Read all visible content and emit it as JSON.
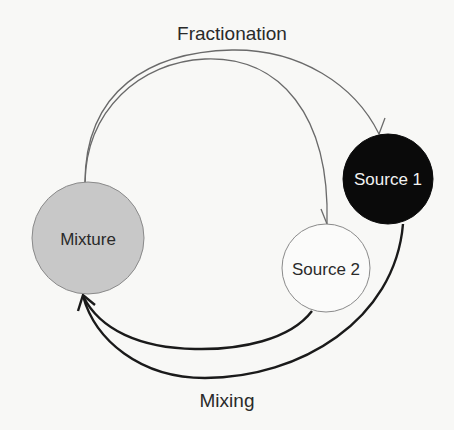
{
  "diagram": {
    "type": "cycle",
    "nodes": [
      {
        "id": "mixture",
        "label": "Mixture",
        "fill": "#c8c8c8",
        "stroke": "#8a8a8a",
        "text_color": "#2a2a2a"
      },
      {
        "id": "source1",
        "label": "Source 1",
        "fill": "#0a0a0a",
        "stroke": "#0a0a0a",
        "text_color": "#f2f2f2"
      },
      {
        "id": "source2",
        "label": "Source 2",
        "fill": "#fbfbfa",
        "stroke": "#8a8a8a",
        "text_color": "#2a2a2a"
      }
    ],
    "edges": [
      {
        "from": "mixture",
        "to": "source1",
        "group": "fractionation"
      },
      {
        "from": "mixture",
        "to": "source2",
        "group": "fractionation"
      },
      {
        "from": "source2",
        "to": "mixture",
        "group": "mixing"
      },
      {
        "from": "source1",
        "to": "mixture",
        "group": "mixing"
      }
    ],
    "labels": {
      "fractionation": "Fractionation",
      "mixing": "Mixing"
    }
  }
}
